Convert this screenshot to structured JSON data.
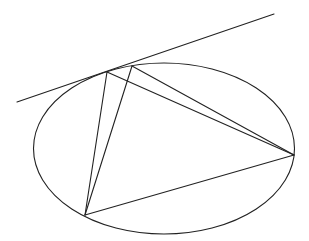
{
  "diagram": {
    "stroke_color": "#222222",
    "background": "#ffffff",
    "ellipse": {
      "cx": 164,
      "cy": 148.5,
      "rx": 130.5,
      "ry": 85.5
    },
    "tangent_line": {
      "x1": 17,
      "y1": 102,
      "x2": 274,
      "y2": 14
    },
    "points": {
      "A": {
        "x": 107,
        "y": 72
      },
      "B": {
        "x": 132,
        "y": 66
      },
      "C": {
        "x": 294,
        "y": 155
      },
      "D": {
        "x": 85,
        "y": 215
      }
    },
    "segments": [
      {
        "from": "A",
        "to": "C"
      },
      {
        "from": "A",
        "to": "D"
      },
      {
        "from": "B",
        "to": "C"
      },
      {
        "from": "B",
        "to": "D"
      },
      {
        "from": "D",
        "to": "C"
      }
    ]
  }
}
